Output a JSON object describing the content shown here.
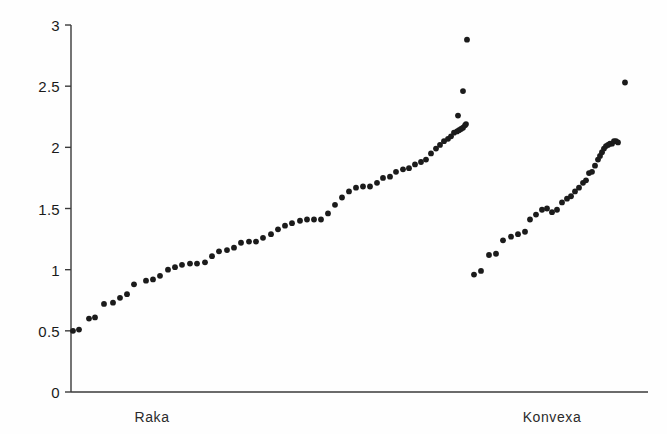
{
  "chart_data": {
    "type": "scatter",
    "title": "",
    "subtitle": "",
    "xlabel": "",
    "ylabel": "",
    "xlim": [
      0,
      1
    ],
    "ylim": [
      0,
      3
    ],
    "grid": false,
    "legend": false,
    "legend_position": "none",
    "axis": {
      "y_ticks": [
        0,
        0.5,
        1,
        1.5,
        2,
        2.5,
        3
      ],
      "y_tick_labels": [
        "0",
        "0.5",
        "1",
        "1.5",
        "2",
        "2.5",
        "3"
      ],
      "x_ticks": [],
      "x_tick_labels": [],
      "y_axis_color": "#3a3a3a",
      "x_axis_color": "#3a3a3a",
      "spines": [
        "left",
        "bottom"
      ]
    },
    "marker": {
      "shape": "circle",
      "color": "#1b1b1b",
      "size_px": 4.6
    },
    "group_labels": [
      "Raka",
      "Konvexa"
    ],
    "series": [
      {
        "name": "Raka",
        "label": "Raka",
        "count": 66,
        "color": "#1b1b1b",
        "x": [
          73,
          79,
          89,
          95,
          104,
          113,
          120,
          127,
          134,
          146,
          153,
          160,
          168,
          175,
          182,
          190,
          197,
          205,
          212,
          219,
          227,
          234,
          241,
          249,
          256,
          263,
          271,
          278,
          285,
          292,
          300,
          307,
          314,
          321,
          328,
          335,
          342,
          349,
          356,
          363,
          370,
          377,
          383,
          390,
          396,
          403,
          409,
          415,
          421,
          426,
          431,
          436,
          440,
          444,
          448,
          451,
          454,
          457,
          459,
          461,
          463,
          465,
          466,
          458,
          463,
          467
        ],
        "y": [
          0.5,
          0.51,
          0.6,
          0.61,
          0.72,
          0.73,
          0.77,
          0.8,
          0.88,
          0.91,
          0.92,
          0.95,
          1.0,
          1.02,
          1.04,
          1.05,
          1.05,
          1.06,
          1.11,
          1.15,
          1.16,
          1.18,
          1.22,
          1.23,
          1.23,
          1.26,
          1.29,
          1.33,
          1.36,
          1.38,
          1.4,
          1.41,
          1.41,
          1.41,
          1.46,
          1.53,
          1.59,
          1.64,
          1.67,
          1.68,
          1.68,
          1.71,
          1.75,
          1.76,
          1.8,
          1.82,
          1.83,
          1.86,
          1.88,
          1.9,
          1.95,
          1.99,
          2.02,
          2.05,
          2.07,
          2.09,
          2.12,
          2.13,
          2.14,
          2.15,
          2.16,
          2.18,
          2.19,
          2.26,
          2.46,
          2.88
        ]
      },
      {
        "name": "Konvexa",
        "label": "Konvexa",
        "count": 36,
        "color": "#1b1b1b",
        "x": [
          474,
          481,
          489,
          496,
          503,
          511,
          518,
          525,
          530,
          536,
          542,
          547,
          552,
          557,
          562,
          567,
          571,
          575,
          579,
          583,
          586,
          589,
          592,
          595,
          598,
          600,
          602,
          604,
          606,
          608,
          610,
          612,
          614,
          616,
          618,
          625
        ],
        "y": [
          0.96,
          0.99,
          1.12,
          1.13,
          1.24,
          1.27,
          1.29,
          1.31,
          1.41,
          1.45,
          1.49,
          1.5,
          1.47,
          1.49,
          1.55,
          1.58,
          1.6,
          1.64,
          1.67,
          1.71,
          1.73,
          1.79,
          1.8,
          1.85,
          1.9,
          1.93,
          1.96,
          1.99,
          2.01,
          2.02,
          2.03,
          2.03,
          2.05,
          2.05,
          2.04,
          2.53
        ]
      }
    ]
  },
  "plot_geometry": {
    "y_axis_x": 71,
    "x_axis_y": 392,
    "x_axis_right": 648,
    "y_axis_top": 25,
    "y_px_at_zero": 392,
    "px_per_unit": 122.33,
    "tick_length": 6
  },
  "group_label_positions": [
    {
      "label": "Raka",
      "x": 152,
      "y": 409
    },
    {
      "label": "Konvexa",
      "x": 552,
      "y": 409
    }
  ]
}
